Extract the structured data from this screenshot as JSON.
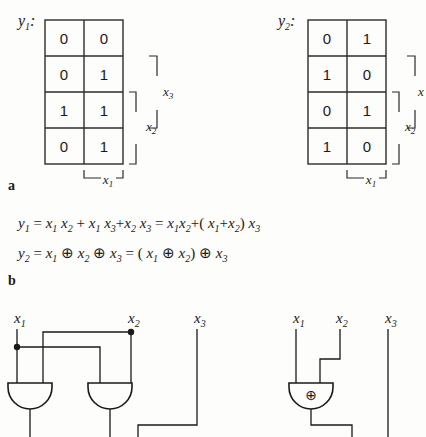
{
  "figure": {
    "part_a": {
      "label": "a",
      "kmaps": [
        {
          "name": "y1",
          "label_base": "y",
          "label_sub": "1",
          "label_suffix": ":",
          "rows": [
            [
              "0",
              "0"
            ],
            [
              "0",
              "1"
            ],
            [
              "1",
              "1"
            ],
            [
              "0",
              "1"
            ]
          ],
          "bracket_bottom": {
            "base": "x",
            "sub": "1"
          },
          "bracket_inner": {
            "base": "x",
            "sub": "2"
          },
          "bracket_outer": {
            "base": "x",
            "sub": "3"
          }
        },
        {
          "name": "y2",
          "label_base": "y",
          "label_sub": "2",
          "label_suffix": ":",
          "rows": [
            [
              "0",
              "1"
            ],
            [
              "1",
              "0"
            ],
            [
              "0",
              "1"
            ],
            [
              "1",
              "0"
            ]
          ],
          "bracket_bottom": {
            "base": "x",
            "sub": "1"
          },
          "bracket_inner": {
            "base": "x",
            "sub": "2"
          },
          "bracket_outer": {
            "base": "x",
            "sub": ""
          }
        }
      ]
    },
    "part_b": {
      "label": "b",
      "equations": [
        {
          "name": "eq-y1",
          "tokens": [
            {
              "t": "var",
              "b": "y",
              "s": "1"
            },
            {
              "t": "op",
              "v": "="
            },
            {
              "t": "var",
              "b": "x",
              "s": "1"
            },
            {
              "t": "var",
              "b": "x",
              "s": "2"
            },
            {
              "t": "op",
              "v": "+"
            },
            {
              "t": "var",
              "b": "x",
              "s": "1"
            },
            {
              "t": "var",
              "b": "x",
              "s": "3"
            },
            {
              "t": "op",
              "v": "+"
            },
            {
              "t": "var",
              "b": "x",
              "s": "2"
            },
            {
              "t": "var",
              "b": "x",
              "s": "3"
            },
            {
              "t": "op",
              "v": "="
            },
            {
              "t": "var",
              "b": "x",
              "s": "1"
            },
            {
              "t": "var",
              "b": "x",
              "s": "2"
            },
            {
              "t": "op",
              "v": "+"
            },
            {
              "t": "op",
              "v": "("
            },
            {
              "t": "var",
              "b": "x",
              "s": "1"
            },
            {
              "t": "op",
              "v": "+"
            },
            {
              "t": "var",
              "b": "x",
              "s": "2"
            },
            {
              "t": "op",
              "v": ")"
            },
            {
              "t": "var",
              "b": "x",
              "s": "3"
            }
          ]
        },
        {
          "name": "eq-y2",
          "tokens": [
            {
              "t": "var",
              "b": "y",
              "s": "2"
            },
            {
              "t": "op",
              "v": "="
            },
            {
              "t": "var",
              "b": "x",
              "s": "1"
            },
            {
              "t": "xor",
              "v": "⊕"
            },
            {
              "t": "var",
              "b": "x",
              "s": "2"
            },
            {
              "t": "xor",
              "v": "⊕"
            },
            {
              "t": "var",
              "b": "x",
              "s": "3"
            },
            {
              "t": "op",
              "v": "="
            },
            {
              "t": "op",
              "v": "("
            },
            {
              "t": "var",
              "b": "x",
              "s": "1"
            },
            {
              "t": "xor",
              "v": "⊕"
            },
            {
              "t": "var",
              "b": "x",
              "s": "2"
            },
            {
              "t": "op",
              "v": ")"
            },
            {
              "t": "xor",
              "v": "⊕"
            },
            {
              "t": "var",
              "b": "x",
              "s": "3"
            }
          ]
        }
      ]
    },
    "part_c": {
      "circuits": [
        {
          "name": "circuit-y1",
          "inputs": [
            {
              "base": "x",
              "sub": "1"
            },
            {
              "base": "x",
              "sub": "2"
            },
            {
              "base": "x",
              "sub": "3"
            }
          ],
          "gates": [
            {
              "type": "and",
              "symbol": ""
            },
            {
              "type": "and",
              "symbol": ""
            }
          ]
        },
        {
          "name": "circuit-y2",
          "inputs": [
            {
              "base": "x",
              "sub": "1"
            },
            {
              "base": "x",
              "sub": "2"
            },
            {
              "base": "x",
              "sub": "3"
            }
          ],
          "gates": [
            {
              "type": "xor",
              "symbol": "⊕"
            }
          ]
        }
      ]
    }
  },
  "colors": {
    "ink": "#1a1a1a",
    "paper": "#fdfdfb",
    "rule": "#2b2b2b"
  }
}
